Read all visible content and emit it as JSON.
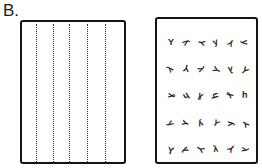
{
  "figure_label": "B.",
  "panels": [
    {
      "id": "left",
      "description": "rectangle with vertical dotted lines",
      "dotted_line_count": 5
    },
    {
      "id": "right",
      "description": "rectangle with grid of small scattered marks",
      "rows": 5,
      "cols": 6
    }
  ],
  "colors": {
    "ink": "#151515",
    "background": "#ffffff"
  }
}
